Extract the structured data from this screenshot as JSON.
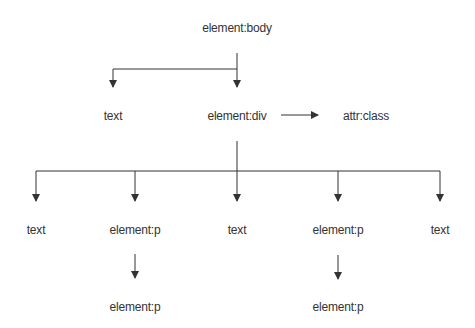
{
  "diagram": {
    "line_color": "#333333",
    "nodes": [
      {
        "id": "body",
        "label": "element:body",
        "x": 237,
        "y": 28
      },
      {
        "id": "text1",
        "label": "text",
        "x": 113,
        "y": 116
      },
      {
        "id": "div",
        "label": "element:div",
        "x": 237,
        "y": 116
      },
      {
        "id": "attr",
        "label": "attr:class",
        "x": 366,
        "y": 116
      },
      {
        "id": "text2",
        "label": "text",
        "x": 36,
        "y": 230
      },
      {
        "id": "p1",
        "label": "element:p",
        "x": 135,
        "y": 230
      },
      {
        "id": "text3",
        "label": "text",
        "x": 237,
        "y": 230
      },
      {
        "id": "p2",
        "label": "element:p",
        "x": 338,
        "y": 230
      },
      {
        "id": "text4",
        "label": "text",
        "x": 440,
        "y": 230
      },
      {
        "id": "p3",
        "label": "element:p",
        "x": 135,
        "y": 307
      },
      {
        "id": "p4",
        "label": "element:p",
        "x": 338,
        "y": 307
      }
    ],
    "edges": [
      {
        "from": "body",
        "to": "text1"
      },
      {
        "from": "body",
        "to": "div"
      },
      {
        "from": "div",
        "to": "attr"
      },
      {
        "from": "div",
        "to": "text2"
      },
      {
        "from": "div",
        "to": "p1"
      },
      {
        "from": "div",
        "to": "text3"
      },
      {
        "from": "div",
        "to": "p2"
      },
      {
        "from": "div",
        "to": "text4"
      },
      {
        "from": "p1",
        "to": "p3"
      },
      {
        "from": "p2",
        "to": "p4"
      }
    ]
  }
}
